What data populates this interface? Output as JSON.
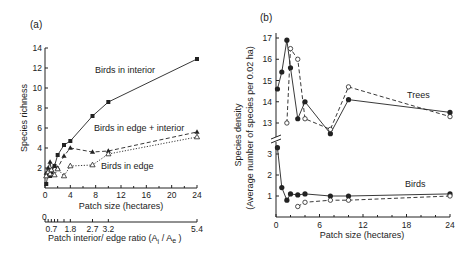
{
  "chart_data": [
    {
      "panel": "(a)",
      "type": "line",
      "xlabel": "Patch size (hectares)",
      "ylabel": "Species richness",
      "xlim": [
        0,
        24
      ],
      "ylim": [
        0,
        14
      ],
      "xticks": [
        0,
        4,
        8,
        12,
        16,
        20,
        24
      ],
      "yticks": [
        2,
        4,
        6,
        8,
        10,
        12,
        14
      ],
      "secondary_xaxis": {
        "label": "Patch interior/ edge ratio (A",
        "label_sub_i": "i",
        "label_mid": " / A",
        "label_sub_e": "e",
        "label_end": " )",
        "zero_label": "0",
        "ticks": [
          {
            "label": "0.7",
            "patch_size": 1
          },
          {
            "label": "1.8",
            "patch_size": 4
          },
          {
            "label": "2.7",
            "patch_size": 7.5
          },
          {
            "label": "3.2",
            "patch_size": 10
          },
          {
            "label": "5.4",
            "patch_size": 24
          }
        ]
      },
      "series": [
        {
          "name": "Birds in interior",
          "marker": "filled-square",
          "dash": "solid",
          "x": [
            0.2,
            0.5,
            0.8,
            1.0,
            1.5,
            2.0,
            3.0,
            4.0,
            7.5,
            10.0,
            24.0
          ],
          "y": [
            0.4,
            1.5,
            1.2,
            1.6,
            2.2,
            3.3,
            4.3,
            4.7,
            7.2,
            8.6,
            12.9
          ]
        },
        {
          "name": "Birds in edge + interior",
          "marker": "filled-triangle",
          "dash": "dashed",
          "x": [
            0.2,
            0.5,
            0.8,
            1.0,
            1.5,
            2.0,
            3.0,
            4.0,
            7.5,
            10.0,
            24.0
          ],
          "y": [
            1.5,
            2.0,
            2.6,
            1.8,
            2.2,
            2.0,
            3.2,
            4.0,
            3.6,
            3.7,
            5.6
          ]
        },
        {
          "name": "Birds in edge",
          "marker": "open-triangle",
          "dash": "dotted",
          "x": [
            0.2,
            0.5,
            0.8,
            1.0,
            1.5,
            2.0,
            3.0,
            4.0,
            7.5,
            10.0,
            24.0
          ],
          "y": [
            1.2,
            1.6,
            1.4,
            1.8,
            1.3,
            1.9,
            1.2,
            2.2,
            2.3,
            3.4,
            5.1
          ]
        }
      ],
      "annotations": [
        "Birds in interior",
        "Birds in edge + interior",
        "Birds in edge"
      ]
    },
    {
      "panel": "(b)",
      "type": "line",
      "xlabel": "Patch size (hectares)",
      "ylabel": "Species density",
      "ylabel2": "(Average number of species per 0.02 ha)",
      "xlim": [
        0,
        24
      ],
      "xticks": [
        0,
        6,
        12,
        18,
        24
      ],
      "broken_yaxis": true,
      "upper_yticks": [
        13,
        14,
        15,
        16,
        17
      ],
      "lower_yticks": [
        1,
        2,
        3
      ],
      "series": [
        {
          "name": "Trees (solid, filled circles)",
          "group": "Trees",
          "marker": "filled-circle",
          "dash": "solid",
          "x": [
            0.2,
            0.8,
            1.5,
            2.0,
            3.0,
            4.0,
            7.5,
            10.0,
            24.0
          ],
          "y": [
            14.6,
            15.4,
            16.9,
            15.6,
            13.2,
            14.0,
            12.5,
            14.1,
            13.5
          ]
        },
        {
          "name": "Trees (dashed, open circles)",
          "group": "Trees",
          "marker": "open-circle",
          "dash": "dashed",
          "x": [
            1.5,
            2.0,
            3.0,
            4.0,
            7.5,
            10.0,
            24.0
          ],
          "y": [
            13.0,
            16.5,
            16.0,
            13.2,
            12.7,
            14.7,
            13.3
          ]
        },
        {
          "name": "Birds (solid, filled circles)",
          "group": "Birds",
          "marker": "filled-circle",
          "dash": "solid",
          "x": [
            0.2,
            0.8,
            1.5,
            2.0,
            3.0,
            4.0,
            7.5,
            10.0,
            24.0
          ],
          "y": [
            3.3,
            1.4,
            0.8,
            1.1,
            1.05,
            1.1,
            1.0,
            1.0,
            1.1
          ]
        },
        {
          "name": "Birds (dashed, open circles)",
          "group": "Birds",
          "marker": "open-circle",
          "dash": "dashed",
          "x": [
            3.0,
            4.0,
            7.5,
            10.0,
            24.0
          ],
          "y": [
            0.5,
            0.7,
            0.8,
            0.8,
            1.0
          ]
        }
      ],
      "annotations": [
        "Trees",
        "Birds"
      ]
    }
  ],
  "labels": {
    "panel_a": "(a)",
    "panel_b": "(b)",
    "a_ylabel": "Species richness",
    "a_xlabel": "Patch size (hectares)",
    "a_x2label_main": "Patch interior/ edge ratio (A",
    "a_x2label_i": "i",
    "a_x2label_mid": " / A",
    "a_x2label_e": "e",
    "a_x2label_end": " )",
    "a_x2_zero": "0",
    "a_ann_interior": "Birds in interior",
    "a_ann_edge_interior": "Birds in edge + interior",
    "a_ann_edge": "Birds in edge",
    "b_ylabel1": "Species density",
    "b_ylabel2": "(Average number of species per 0.02 ha)",
    "b_xlabel": "Patch size (hectares)",
    "b_ann_trees": "Trees",
    "b_ann_birds": "Birds"
  }
}
